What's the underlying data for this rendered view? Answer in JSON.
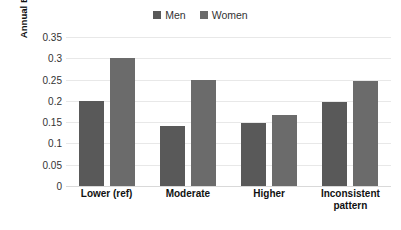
{
  "chart_data": {
    "type": "bar",
    "title": "",
    "subtitle": "",
    "xlabel": "",
    "ylabel": "Annual BMI change (kg m⁻²)",
    "ylabel_main": "Annual BMI change (kg m",
    "ylabel_exponent": "−2",
    "ylabel_tail": ")",
    "categories": [
      "Lower (ref)",
      "Moderate",
      "Higher",
      "Inconsistent pattern"
    ],
    "series": [
      {
        "name": "Men",
        "values": [
          0.2,
          0.14,
          0.148,
          0.197
        ],
        "color": "#595959"
      },
      {
        "name": "Women",
        "values": [
          0.3,
          0.248,
          0.167,
          0.246
        ],
        "color": "#6b6b6b"
      }
    ],
    "ylim": [
      0,
      0.35
    ],
    "ytick_values": [
      0,
      0.05,
      0.1,
      0.15,
      0.2,
      0.25,
      0.3,
      0.35
    ],
    "ytick_labels": [
      "0",
      "0.05",
      "0.1",
      "0.15",
      "0.2",
      "0.25",
      "0.3",
      "0.35"
    ],
    "grid": true,
    "grid_color": "#e8e8e8",
    "legend_position": "top-center",
    "background": "#ffffff"
  },
  "legend": {
    "entries": [
      {
        "label": "Men",
        "color": "#595959"
      },
      {
        "label": "Women",
        "color": "#6b6b6b"
      }
    ]
  }
}
